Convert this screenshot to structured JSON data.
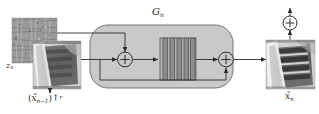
{
  "figure": {
    "type": "block-diagram",
    "background_color": "#ffffff",
    "line_color": "#2b2b2b",
    "block_fill": "#c9c9c9",
    "layer_fill": "#a8a8a8"
  },
  "labels": {
    "noise_input": {
      "base": "z",
      "subscript": "n",
      "full": "z_n",
      "role": "noise-map-label"
    },
    "generator_block": {
      "base": "G",
      "subscript": "n",
      "full": "G_n",
      "role": "generator-stage-label"
    },
    "image_input": {
      "open": "(",
      "base": "x̃",
      "subscript": "n−1",
      "close": ")",
      "operator": "↑",
      "superscript": "r",
      "full": "(x̃_{n−1})↑^r",
      "role": "upsampled-previous-output-label"
    },
    "image_output": {
      "base": "x̃",
      "subscript": "n",
      "full": "x̃_n",
      "role": "stage-output-label"
    }
  },
  "nodes": {
    "noise_patch": {
      "name": "noise-map-thumbnail",
      "kind": "image-patch",
      "appearance": "grayscale random noise texture"
    },
    "input_patch": {
      "name": "input-image-thumbnail",
      "kind": "image-patch",
      "appearance": "blurry grayscale photo of a building"
    },
    "output_patch": {
      "name": "output-image-thumbnail",
      "kind": "image-patch",
      "appearance": "sharper grayscale photo of a building"
    },
    "adder_left": {
      "name": "add-noise-operator",
      "symbol": "⊕",
      "kind": "circled-plus"
    },
    "adder_right": {
      "name": "residual-sum-operator",
      "symbol": "⊕",
      "kind": "circled-plus"
    },
    "downsample_op": {
      "name": "feedback-operator",
      "symbol": "⊕",
      "kind": "circled-plus"
    },
    "conv_stack": {
      "name": "residual-block-stack",
      "kind": "layer-stack",
      "layer_count": 5
    }
  },
  "edges": [
    {
      "name": "edge-noise-to-adder",
      "from": "noise_patch",
      "to": "adder_left",
      "style": "solid-arrow"
    },
    {
      "name": "edge-input-to-adder",
      "from": "input_patch",
      "to": "adder_left",
      "style": "solid-arrow"
    },
    {
      "name": "edge-adder-to-stack",
      "from": "adder_left",
      "to": "conv_stack",
      "style": "solid-arrow"
    },
    {
      "name": "edge-stack-to-sum",
      "from": "conv_stack",
      "to": "adder_right",
      "style": "solid-arrow"
    },
    {
      "name": "edge-skip-connection",
      "from": "adder_left",
      "to": "adder_right",
      "style": "solid-arrow-bottom-bypass"
    },
    {
      "name": "edge-sum-to-output",
      "from": "adder_right",
      "to": "output_patch",
      "style": "solid-arrow"
    },
    {
      "name": "edge-output-to-feedback",
      "from": "output_patch",
      "to": "downsample_op",
      "style": "solid-arrow-up"
    }
  ]
}
